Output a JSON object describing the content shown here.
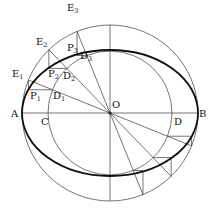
{
  "diagram": {
    "center": {
      "x": 110,
      "y": 113
    },
    "outer_circle_radius": 88,
    "inner_circle_radius": 62,
    "ellipse": {
      "rx": 88,
      "ry": 63
    },
    "construction_angles_deg": [
      158,
      134,
      112
    ],
    "opposite_angles_deg": [
      -22,
      -46,
      -68
    ],
    "colors": {
      "line": "#3a3a3a",
      "ellipse": "#111111",
      "text": "#111111",
      "background": "#ffffff"
    },
    "labels": {
      "A": {
        "text": "A",
        "x": 11,
        "y": 117
      },
      "B": {
        "text": "B",
        "x": 199,
        "y": 117
      },
      "C": {
        "text": "C",
        "x": 41,
        "y": 125
      },
      "D": {
        "text": "D",
        "x": 174,
        "y": 125
      },
      "O": {
        "text": "O",
        "x": 112,
        "y": 108
      },
      "E1": {
        "text": "E",
        "sub": "1",
        "x": 12,
        "y": 77
      },
      "E2": {
        "text": "E",
        "sub": "2",
        "x": 36,
        "y": 45
      },
      "E3": {
        "text": "E",
        "sub": "3",
        "x": 67,
        "y": 11
      },
      "P1": {
        "text": "P",
        "sub": "1",
        "x": 30,
        "y": 99
      },
      "P2": {
        "text": "P",
        "sub": "2",
        "x": 48,
        "y": 77
      },
      "P3": {
        "text": "P",
        "sub": "3",
        "x": 67,
        "y": 51
      },
      "D1": {
        "text": "D",
        "sub": "1",
        "x": 53,
        "y": 99
      },
      "D2": {
        "text": "D",
        "sub": "2",
        "x": 63,
        "y": 79
      },
      "D3": {
        "text": "D",
        "sub": "3",
        "x": 80,
        "y": 59
      }
    }
  }
}
